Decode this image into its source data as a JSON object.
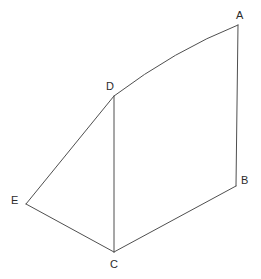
{
  "figure": {
    "background_color": "#ffffff",
    "stroke_color": "#4f4f4f",
    "label_color": "#2b2b2b",
    "stroke_width": 1,
    "canvas": {
      "width": 261,
      "height": 279
    },
    "vertices": [
      {
        "id": "A",
        "label": "A",
        "x": 238,
        "y": 25,
        "label_x": 236,
        "label_y": 10
      },
      {
        "id": "B",
        "label": "B",
        "x": 236,
        "y": 186,
        "label_x": 241,
        "label_y": 175
      },
      {
        "id": "C",
        "label": "C",
        "x": 114,
        "y": 252,
        "label_x": 110,
        "label_y": 259
      },
      {
        "id": "D",
        "label": "D",
        "x": 114,
        "y": 96,
        "label_x": 106,
        "label_y": 81
      },
      {
        "id": "E",
        "label": "E",
        "x": 26,
        "y": 204,
        "label_x": 11,
        "label_y": 195
      }
    ],
    "edges": [
      {
        "id": "DA",
        "from": "D",
        "to": "A",
        "shape": "curve",
        "control_x": 175,
        "control_y": 50
      },
      {
        "id": "AB",
        "from": "A",
        "to": "B",
        "shape": "line"
      },
      {
        "id": "BC",
        "from": "B",
        "to": "C",
        "shape": "line"
      },
      {
        "id": "CE",
        "from": "C",
        "to": "E",
        "shape": "line"
      },
      {
        "id": "ED",
        "from": "E",
        "to": "D",
        "shape": "line"
      },
      {
        "id": "DC",
        "from": "D",
        "to": "C",
        "shape": "line"
      }
    ]
  }
}
